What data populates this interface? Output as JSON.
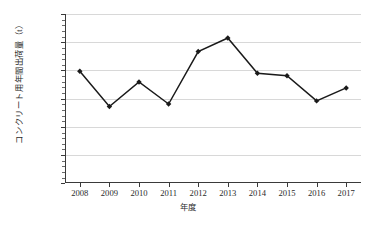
{
  "chart_data": {
    "type": "line",
    "title": "",
    "xlabel": "年度",
    "ylabel": "コンクリート用年間出荷量（t）",
    "categories": [
      "2008",
      "2009",
      "2010",
      "2011",
      "2012",
      "2013",
      "2014",
      "2015",
      "2016",
      "2017"
    ],
    "series": [
      {
        "name": "コンクリート用年間出荷量",
        "values": [
          39700,
          27200,
          35900,
          28100,
          46700,
          51500,
          39000,
          38100,
          29200,
          33800
        ]
      }
    ],
    "ylim": [
      0,
      60000
    ],
    "ytick_values": [
      0,
      10000,
      20000,
      30000,
      40000,
      50000,
      60000
    ],
    "ytick_labels": [
      "0",
      "10,000",
      "20,000",
      "30,000",
      "40,000",
      "50,000",
      "60,000"
    ],
    "y_minor_tick_interval": 2000,
    "grid": "horizontal",
    "legend": "none",
    "marker": "diamond",
    "line_color": "#1a1a1a",
    "marker_color": "#1a1a1a",
    "grid_color": "#d8d8d8",
    "axis_color": "#3a3a3a",
    "background_color": "#ffffff"
  }
}
